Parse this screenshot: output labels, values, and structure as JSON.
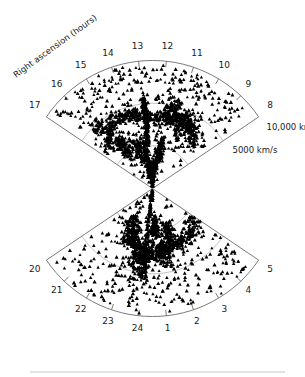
{
  "figure": {
    "axis_title": "Right ascension (hours)",
    "background_color": "#ffffff",
    "outline_color": "#6b6b6b",
    "inner_arc_color": "#9a9a9a",
    "point_color": "#000000"
  },
  "chart_data": {
    "type": "scatter",
    "title": "Right ascension (hours)",
    "subtitle": "",
    "projection": "polar-wedge",
    "xlabel": "Right ascension (hours)",
    "ylabel": "Recession velocity (km/s)",
    "grid": true,
    "legend_position": "none",
    "radial_axis": {
      "label": "Recession velocity",
      "unit": "km/s",
      "range": [
        0,
        15000
      ],
      "tick_labels": [
        "5000 km/s",
        "10,000 km/s"
      ],
      "tick_values": [
        5000,
        10000
      ],
      "gridline_values": [
        5000,
        10000,
        15000
      ]
    },
    "angular_axis": {
      "label": "Right ascension (hours)",
      "unit": "hours",
      "range": [
        8,
        17
      ],
      "wedges": [
        {
          "name": "north-wedge",
          "ra_start": 17,
          "ra_end": 8,
          "tick_labels": [
            "17",
            "16",
            "15",
            "14",
            "13",
            "12",
            "11",
            "10",
            "9",
            "8"
          ],
          "tick_values": [
            17,
            16,
            15,
            14,
            13,
            12,
            11,
            10,
            9,
            8
          ]
        },
        {
          "name": "south-wedge",
          "ra_start": 20,
          "ra_end": 5,
          "tick_labels": [
            "20",
            "21",
            "22",
            "23",
            "24",
            "1",
            "2",
            "3",
            "4",
            "5"
          ],
          "tick_values": [
            20,
            21,
            22,
            23,
            24,
            1,
            2,
            3,
            4,
            5
          ]
        }
      ]
    },
    "series": [
      {
        "name": "galaxies-north",
        "marker": "triangle",
        "color": "#000000",
        "count": 1100
      },
      {
        "name": "galaxies-south",
        "marker": "triangle",
        "color": "#000000",
        "count": 760
      }
    ]
  },
  "labels": {
    "velocity": {
      "outer": "10,000 km/s",
      "inner": "5000 km/s"
    },
    "north_ticks": [
      "17",
      "16",
      "15",
      "14",
      "13",
      "12",
      "11",
      "10",
      "9",
      "8"
    ],
    "south_ticks": [
      "20",
      "21",
      "22",
      "23",
      "24",
      "1",
      "2",
      "3",
      "4",
      "5"
    ]
  }
}
